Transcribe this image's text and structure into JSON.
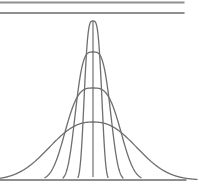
{
  "chart_data": {
    "type": "line",
    "title": "",
    "xlabel": "",
    "ylabel": "",
    "axes_visible": false,
    "grid": false,
    "legend": "none",
    "canvas": {
      "width": 199,
      "height": 187
    },
    "top_rules": [
      {
        "y": 2.5,
        "x1": 0,
        "x2": 184.5
      },
      {
        "y": 13,
        "x1": 0,
        "x2": 184.5
      }
    ],
    "baseline": {
      "y": 180,
      "x1": 0,
      "x2": 186.5
    },
    "mean_line": {
      "x": 93,
      "y1": 21,
      "y2": 177
    },
    "curves": [
      {
        "name": "curve-1-narrowest-tallest",
        "center": 93,
        "peak_y": 21,
        "height": 159,
        "spread": 10,
        "power": 3.5,
        "x_start": 78,
        "x_end": 108
      },
      {
        "name": "curve-2",
        "center": 93,
        "peak_y": 52,
        "height": 128,
        "spread": 20,
        "power": 3.5,
        "x_start": 63,
        "x_end": 123
      },
      {
        "name": "curve-3",
        "center": 93,
        "peak_y": 88,
        "height": 92,
        "spread": 32,
        "power": 3.2,
        "x_start": 45,
        "x_end": 141
      },
      {
        "name": "curve-4-widest-flattest",
        "center": 93,
        "peak_y": 122,
        "height": 58,
        "spread": 55,
        "power": 2.4,
        "x_start": -2,
        "x_end": 197
      }
    ],
    "colors": {
      "curve": "#6f6f6f",
      "rule": "#8f8f8f",
      "background": "#ffffff"
    }
  }
}
